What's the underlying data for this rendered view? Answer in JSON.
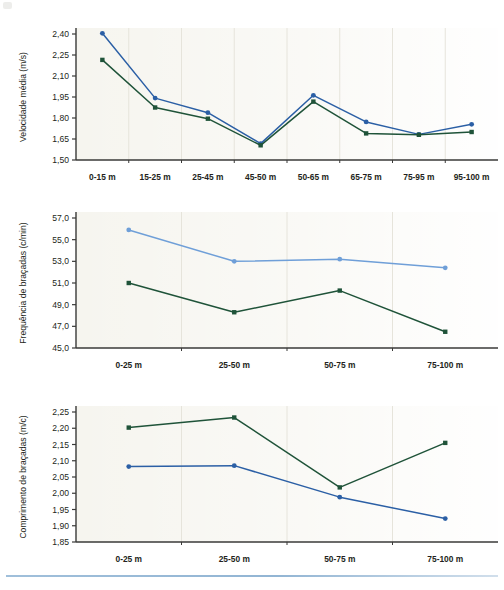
{
  "document": {
    "kind": "figure-page",
    "chart_count": 3,
    "footer_rule_color": "#7fa8cc"
  },
  "palette": {
    "series_blue_dark": "#2b5fa5",
    "series_blue_light": "#6f9fd8",
    "series_green_dark": "#1f5339",
    "plot_background": "#f6f5ef",
    "axis_line": "#3a3a38",
    "gridline": "#e6e4db",
    "text": "#231f20"
  },
  "chart_data": [
    {
      "id": "velocidade-media",
      "type": "line",
      "title": "",
      "xlabel": "",
      "ylabel": "Velocidade média (m/s)",
      "categories": [
        "0-15 m",
        "15-25 m",
        "25-45 m",
        "45-50 m",
        "50-65 m",
        "65-75 m",
        "75-95 m",
        "95-100 m"
      ],
      "ylim": [
        1.5,
        2.4
      ],
      "yticks": [
        "2,40",
        "2,25",
        "2,10",
        "1,95",
        "1,80",
        "1,65",
        "1,50"
      ],
      "ytick_values": [
        2.4,
        2.25,
        2.1,
        1.95,
        1.8,
        1.65,
        1.5
      ],
      "grid": "vertical",
      "legend": "none",
      "series": [
        {
          "name": "series-blue",
          "color": "#2b5fa5",
          "marker": "circle",
          "values": [
            2.405,
            1.942,
            1.838,
            1.617,
            1.962,
            1.772,
            1.683,
            1.755
          ]
        },
        {
          "name": "series-green",
          "color": "#1f5339",
          "marker": "square",
          "values": [
            2.215,
            1.875,
            1.795,
            1.605,
            1.917,
            1.69,
            1.68,
            1.7
          ]
        }
      ]
    },
    {
      "id": "frequencia-bracadas",
      "type": "line",
      "title": "",
      "xlabel": "",
      "ylabel": "Frequência de braçadas (c/min)",
      "categories": [
        "0-25 m",
        "25-50 m",
        "50-75 m",
        "75-100 m"
      ],
      "ylim": [
        45.0,
        57.0
      ],
      "yticks": [
        "57,0",
        "55,0",
        "53,0",
        "51,0",
        "49,0",
        "47,0",
        "45,0"
      ],
      "ytick_values": [
        57.0,
        55.0,
        53.0,
        51.0,
        49.0,
        47.0,
        45.0
      ],
      "grid": "vertical",
      "legend": "none",
      "series": [
        {
          "name": "series-blue",
          "color": "#6f9fd8",
          "marker": "circle",
          "values": [
            55.9,
            53.0,
            53.2,
            52.4
          ]
        },
        {
          "name": "series-green",
          "color": "#1f5339",
          "marker": "square",
          "values": [
            51.0,
            48.3,
            50.3,
            46.5
          ]
        }
      ]
    },
    {
      "id": "comprimento-bracadas",
      "type": "line",
      "title": "",
      "xlabel": "",
      "ylabel": "Comprimento de braçadas (m/c)",
      "categories": [
        "0-25 m",
        "25-50 m",
        "50-75 m",
        "75-100 m"
      ],
      "ylim": [
        1.85,
        2.25
      ],
      "yticks": [
        "2,25",
        "2,20",
        "2,15",
        "2,10",
        "2,05",
        "2,00",
        "1,95",
        "1,90",
        "1,85"
      ],
      "ytick_values": [
        2.25,
        2.2,
        2.15,
        2.1,
        2.05,
        2.0,
        1.95,
        1.9,
        1.85
      ],
      "grid": "vertical",
      "legend": "none",
      "series": [
        {
          "name": "series-green",
          "color": "#1f5339",
          "marker": "square",
          "values": [
            2.202,
            2.233,
            2.018,
            2.155
          ]
        },
        {
          "name": "series-blue",
          "color": "#2b5fa5",
          "marker": "circle",
          "values": [
            2.082,
            2.085,
            1.988,
            1.922
          ]
        }
      ]
    }
  ]
}
